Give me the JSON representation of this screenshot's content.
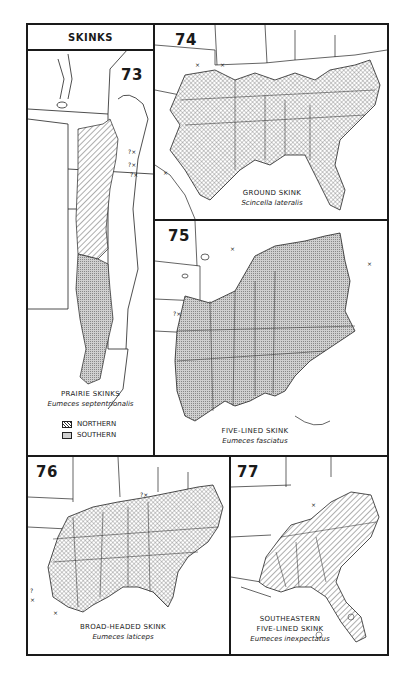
{
  "header": {
    "title": "SKINKS"
  },
  "panels": [
    {
      "number": "73",
      "common_name": "PRAIRIE SKINKS",
      "scientific_name": "Eumeces septentrionalis",
      "legend": [
        {
          "label": "NORTHERN",
          "pattern": "diagonal-hatch"
        },
        {
          "label": "SOUTHERN",
          "pattern": "stipple"
        }
      ]
    },
    {
      "number": "74",
      "common_name": "GROUND SKINK",
      "scientific_name": "Scincella lateralis",
      "pattern": "crosshatch"
    },
    {
      "number": "75",
      "common_name": "FIVE-LINED SKINK",
      "scientific_name": "Eumeces fasciatus",
      "pattern": "stipple"
    },
    {
      "number": "76",
      "common_name": "BROAD-HEADED SKINK",
      "scientific_name": "Eumeces laticeps",
      "pattern": "crosshatch"
    },
    {
      "number": "77",
      "common_name_line1": "SOUTHEASTERN",
      "common_name_line2": "FIVE-LINED SKINK",
      "scientific_name": "Eumeces inexpectatus",
      "pattern": "diagonal-hatch"
    }
  ],
  "markers": {
    "outlier": "×",
    "questionable": "?×"
  },
  "colors": {
    "ink": "#1a1a1a",
    "range_fill": "#bdbdbd",
    "background": "#ffffff"
  }
}
